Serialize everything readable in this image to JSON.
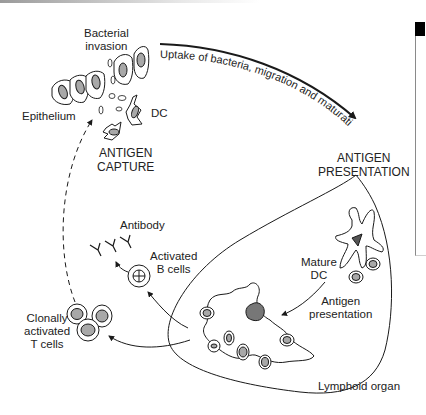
{
  "diagram": {
    "type": "biology-process-diagram",
    "topic": "Dendritic cell antigen capture and presentation",
    "labels": {
      "bacterial_invasion": [
        "Bacterial",
        "invasion"
      ],
      "epithelium": "Epithelium",
      "dc": "DC",
      "antigen_capture": [
        "ANTIGEN",
        "CAPTURE"
      ],
      "uptake_arrow": "Uptake of bacteria, migration and maturation",
      "antigen_presentation_title": [
        "ANTIGEN",
        "PRESENTATION"
      ],
      "antibody": "Antibody",
      "activated_b_cells": [
        "Activated",
        "B cells"
      ],
      "mature_dc": [
        "Mature",
        "DC"
      ],
      "antigen_presentation": [
        "Antigen",
        "presentation"
      ],
      "clonally_activated_t_cells": [
        "Clonally",
        "activated",
        "T cells"
      ],
      "lymphoid_organ": "Lymphoid organ"
    },
    "flow": [
      {
        "from": "antigen_capture",
        "to": "antigen_presentation",
        "label": "Uptake of bacteria, migration and maturation",
        "style": "solid"
      },
      {
        "from": "mature_dc",
        "to": "lymphoid_organ_dc",
        "label": "Antigen presentation",
        "style": "solid"
      },
      {
        "from": "lymphoid_organ",
        "to": "activated_b_cells",
        "style": "solid"
      },
      {
        "from": "activated_b_cells",
        "to": "antibody",
        "style": "solid"
      },
      {
        "from": "lymphoid_organ",
        "to": "clonally_activated_t_cells",
        "style": "solid"
      },
      {
        "from": "clonally_activated_t_cells",
        "to": "epithelium",
        "style": "dashed"
      }
    ],
    "colors": {
      "line": "#1a1a1a",
      "nucleus_fill": "#a8a8a8",
      "dc_core": "#555555",
      "background": "#ffffff"
    }
  }
}
